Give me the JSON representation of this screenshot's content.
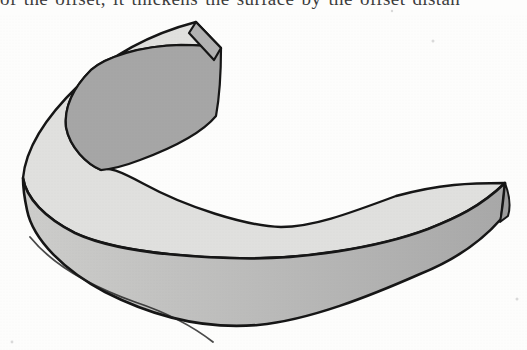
{
  "page": {
    "background": "#fdfdfc"
  },
  "caption": {
    "text": "of the offset, it thickens the surface by the offset distan"
  },
  "figure": {
    "colors": {
      "top_surface": "#e0e0de",
      "inner_wall": "#a6a6a6",
      "outer_wall_light": "#cdcdcb",
      "outer_wall_dark": "#a8a8a8",
      "upper_end_cap": "#b2b2b2",
      "right_end_cap": "#9c9c9c",
      "outline": "#161616",
      "speck": "#d9d9d9"
    }
  }
}
